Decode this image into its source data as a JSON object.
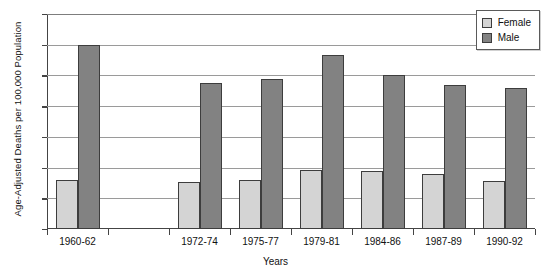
{
  "chart_data": {
    "type": "bar",
    "title": "",
    "xlabel": "Years",
    "ylabel": "Age-Adjusted Deaths per 100,000 Population",
    "ylim": [
      0,
      7
    ],
    "ytick_step": 1,
    "yticks": [
      "0",
      "1",
      "2",
      "3",
      "4",
      "5",
      "6",
      "7"
    ],
    "grid": true,
    "legend_position": "top-right",
    "categories": [
      "1960-62",
      "",
      "1972-74",
      "1975-77",
      "1979-81",
      "1984-86",
      "1987-89",
      "1990-92"
    ],
    "series": [
      {
        "name": "Female",
        "color": "#d4d4d4",
        "values": [
          1.58,
          null,
          1.52,
          1.6,
          1.92,
          1.88,
          1.78,
          1.57
        ]
      },
      {
        "name": "Male",
        "color": "#828282",
        "values": [
          5.98,
          null,
          4.76,
          4.88,
          5.65,
          5.0,
          4.68,
          4.6
        ]
      }
    ]
  },
  "legend": {
    "entries": [
      {
        "label": "Female"
      },
      {
        "label": "Male"
      }
    ]
  },
  "colors": {
    "female": "#d4d4d4",
    "male": "#828282",
    "bar_border": "#3d3d3d",
    "gridline": "#9a9a9a",
    "axis": "#444444"
  }
}
